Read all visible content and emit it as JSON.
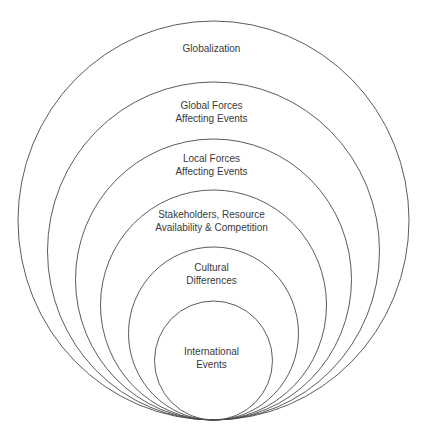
{
  "diagram": {
    "type": "nested-circles",
    "colors": {
      "stroke": "#4a4a4a",
      "text": "#3a3a3a",
      "background": "#ffffff"
    },
    "layers": [
      {
        "lines": [
          "Globalization"
        ]
      },
      {
        "lines": [
          "Global Forces",
          "Affecting Events"
        ]
      },
      {
        "lines": [
          "Local Forces",
          "Affecting Events"
        ]
      },
      {
        "lines": [
          "Stakeholders, Resource",
          "Availability & Competition"
        ]
      },
      {
        "lines": [
          "Cultural",
          "Differences"
        ]
      },
      {
        "lines": [
          "International",
          "Events"
        ]
      }
    ]
  }
}
